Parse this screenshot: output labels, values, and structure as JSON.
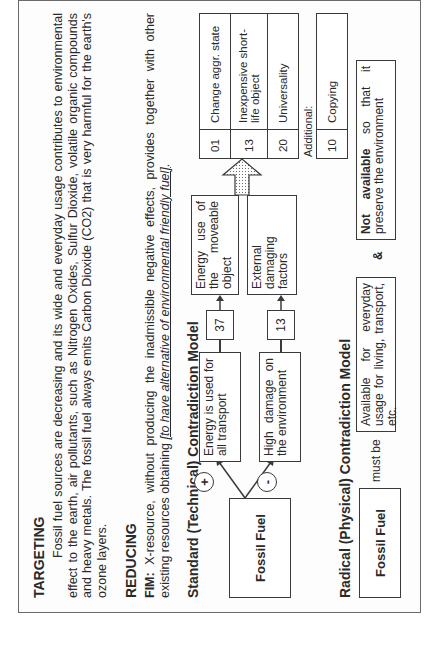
{
  "targeting": {
    "heading": "TARGETING",
    "paragraph": "Fossil fuel sources are decreasing and its wide and everyday usage contributes to environmental effect to the earth, air pollutants, such as Nitrogen Oxides, Sulfur Dioxide, volatile organic compounds and heavy metals. The fossil fuel always emits Carbon Dioxide (CO2) that is very harmful for the earth's ozone layers."
  },
  "reducing": {
    "heading": "REDUCING",
    "fim_label": "FIM:",
    "fim_text": "X-resource, without producing the inadmissible negative effects, provides together with other existing resources obtaining",
    "fim_underlined": "[to have alternative of environmental friendly fuel]",
    "fim_end": "."
  },
  "standard_model": {
    "title": "Standard (Technical) Contradiction Model",
    "source_box": "Fossil Fuel",
    "plus_sign": "+",
    "minus_sign": "-",
    "positive_effect": "Energy is used for all transport",
    "negative_effect": "High damage on the environment",
    "positive_param_number": "37",
    "negative_param_number": "13",
    "positive_param": "Energy use of the moveable object",
    "negative_param": "External damaging factors",
    "principles": [
      {
        "num": "01",
        "label": "Change aggr. state"
      },
      {
        "num": "13",
        "label": "Inexpensive short-life object"
      },
      {
        "num": "20",
        "label": "Universality"
      }
    ],
    "additional_label": "Additional:",
    "additional": [
      {
        "num": "10",
        "label": "Copying"
      }
    ]
  },
  "radical_model": {
    "title": "Radical (Physical) Contradiction Model",
    "source_box": "Fossil Fuel",
    "must_be": "must be",
    "requirement_a": "Available for everyday usage for living, transport, etc.",
    "ampersand": "&",
    "requirement_b_bold": "Not available",
    "requirement_b": " so that it preserve the environment"
  }
}
